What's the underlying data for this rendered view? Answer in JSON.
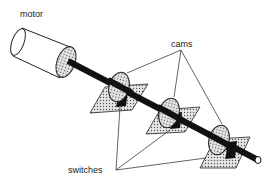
{
  "diagram": {
    "labels": {
      "motor": "motor",
      "cams": "cams",
      "switches": "switches"
    },
    "components": [
      {
        "id": "motor",
        "type": "cylinder"
      },
      {
        "id": "shaft",
        "type": "rod"
      },
      {
        "id": "cam-1",
        "type": "cam"
      },
      {
        "id": "cam-2",
        "type": "cam"
      },
      {
        "id": "cam-3",
        "type": "cam"
      },
      {
        "id": "switch-1",
        "type": "switch"
      },
      {
        "id": "switch-2",
        "type": "switch"
      },
      {
        "id": "switch-3",
        "type": "switch"
      }
    ],
    "colors": {
      "ink": "#111111",
      "fill": "#c8c8c8",
      "background": "#ffffff"
    }
  }
}
